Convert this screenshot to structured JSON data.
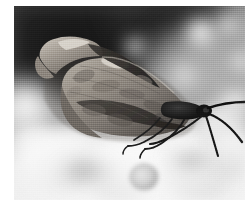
{
  "image": {
    "title": "Butterfly on white flowers",
    "subject": "butterfly",
    "species_appearance": "leafwing / anglewing butterfly with hooked forewing tip, wings closed",
    "orientation": "landscape",
    "color_mode": "black and white",
    "style": "macro nature photograph, shallow depth of field",
    "canvas": {
      "width": 245,
      "height": 212
    },
    "photo_area": {
      "left": 14,
      "top": 6,
      "width": 231,
      "height": 194
    },
    "page_background": "#ffffff"
  },
  "palette": {
    "page_white": "#ffffff",
    "background_dark": "#1d1d1d",
    "background_mid_gray": "#8d8d8d",
    "background_light_gray": "#c6c6c6",
    "flower_white": "#fafafa",
    "wing_light": "#b9b3aa",
    "wing_mid": "#8d867c",
    "wing_dark": "#4a453f",
    "wing_shadow": "#2b2926",
    "body_black": "#141414",
    "antenna_black": "#101010"
  },
  "scene": {
    "background_regions": [
      {
        "name": "dark-blurred-foliage-top-left",
        "tone": "near-black",
        "hex": "#232323"
      },
      {
        "name": "mid-gray-bokeh-right",
        "tone": "mid-gray",
        "hex": "#a8a8a8"
      },
      {
        "name": "bright-flower-cluster-bottom",
        "tone": "white",
        "hex": "#f7f7f7"
      }
    ],
    "bokeh_highlights": [
      {
        "name": "bokeh-top-right-large",
        "x": 188,
        "y": 30,
        "size": 26
      },
      {
        "name": "bokeh-top-right-small",
        "x": 214,
        "y": 22,
        "size": 16
      },
      {
        "name": "bokeh-right-upper",
        "x": 226,
        "y": 56,
        "size": 14
      },
      {
        "name": "bokeh-mid-right",
        "x": 168,
        "y": 70,
        "size": 18
      },
      {
        "name": "bokeh-far-right",
        "x": 222,
        "y": 96,
        "size": 20
      },
      {
        "name": "bokeh-left-edge",
        "x": 8,
        "y": 92,
        "size": 30
      },
      {
        "name": "bokeh-upper-mid",
        "x": 120,
        "y": 42,
        "size": 15
      }
    ],
    "flower_petals": [
      {
        "name": "petal-bottom-left-large",
        "x": 40,
        "y": 150
      },
      {
        "name": "petal-bottom-center",
        "x": 110,
        "y": 160
      },
      {
        "name": "petal-bottom-right",
        "x": 170,
        "y": 150
      },
      {
        "name": "petal-right-leaf",
        "x": 205,
        "y": 120
      },
      {
        "name": "flower-bud-circle",
        "x": 128,
        "y": 172,
        "size": 17
      }
    ]
  },
  "butterfly": {
    "parts": [
      {
        "name": "forewing-upper",
        "label": "hooked forewing tip (upper left)"
      },
      {
        "name": "hindwing-main",
        "label": "large mottled hindwing"
      },
      {
        "name": "wing-dark-band",
        "label": "dark diagonal band across wing"
      },
      {
        "name": "wing-light-patch",
        "label": "pale patch near leading edge"
      },
      {
        "name": "thorax",
        "label": "dark thorax"
      },
      {
        "name": "head",
        "label": "head"
      },
      {
        "name": "antenna-upper",
        "label": "upper antenna extending right"
      },
      {
        "name": "antenna-lower",
        "label": "lower antenna extending right"
      },
      {
        "name": "proboscis",
        "label": "curved proboscis"
      },
      {
        "name": "leg-front",
        "label": "front leg"
      },
      {
        "name": "leg-mid",
        "label": "middle leg"
      },
      {
        "name": "leg-hind",
        "label": "hind leg"
      }
    ],
    "pose": "perched facing right with wings folded vertically",
    "wing_span_px": 200
  },
  "caption": ""
}
